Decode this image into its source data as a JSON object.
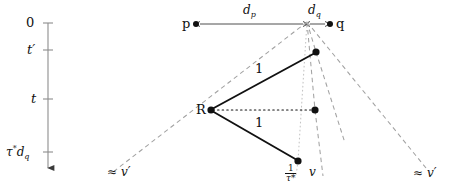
{
  "figure": {
    "type": "geometric-spacetime-diagram",
    "background": "#ffffff",
    "ink": "#111111",
    "dash_color": "#9a9a9a",
    "dot_color": "#bdbdbd"
  },
  "time_axis": {
    "name": "vertical-time-axis",
    "ticks": [
      {
        "id": "t0",
        "label": "0",
        "y": 23
      },
      {
        "id": "tprime",
        "label": "t′",
        "y": 50
      },
      {
        "id": "t",
        "label": "t",
        "y": 99
      },
      {
        "id": "tau",
        "label_parts": {
          "tau": "τ",
          "star": "*",
          "d": "d",
          "sub": "q"
        },
        "label": "τ*d_q",
        "y": 152
      }
    ]
  },
  "top_ruler": {
    "name": "horizontal-distance-ruler",
    "left_point_label": "p",
    "right_point_label": "q",
    "segments": [
      {
        "id": "dp",
        "label": "d",
        "subscript": "p"
      },
      {
        "id": "dq",
        "label": "d",
        "subscript": "q"
      }
    ]
  },
  "nodes": [
    {
      "id": "p",
      "label": "p",
      "x": 196,
      "y": 24
    },
    {
      "id": "apex",
      "label": "",
      "x": 307,
      "y": 22
    },
    {
      "id": "q",
      "label": "q",
      "x": 330,
      "y": 24
    },
    {
      "id": "R",
      "label": "R",
      "x": 211,
      "y": 110
    },
    {
      "id": "upper",
      "label": "",
      "x": 316,
      "y": 52
    },
    {
      "id": "middle",
      "label": "",
      "x": 315,
      "y": 110
    },
    {
      "id": "lower",
      "label": "",
      "x": 298,
      "y": 161
    }
  ],
  "edges": [
    {
      "id": "R-upper",
      "label": "1",
      "style": "solid",
      "label_x": 258,
      "label_y": 68
    },
    {
      "id": "R-lower",
      "label": "1",
      "style": "solid",
      "label_x": 258,
      "label_y": 122
    },
    {
      "id": "R-middle",
      "label": "",
      "style": "dotted"
    }
  ],
  "ray_labels": [
    {
      "id": "left-vprime",
      "approx": "≈",
      "value": "v′",
      "x": 112,
      "y": 169
    },
    {
      "id": "center-invtau",
      "fraction": {
        "numerator": "1",
        "denominator": "τ*"
      },
      "x": 288,
      "y": 168
    },
    {
      "id": "center-v",
      "approx": "",
      "value": "v",
      "x": 311,
      "y": 168
    },
    {
      "id": "right-vprime",
      "approx": "≈",
      "value": "v′",
      "x": 418,
      "y": 170
    }
  ]
}
